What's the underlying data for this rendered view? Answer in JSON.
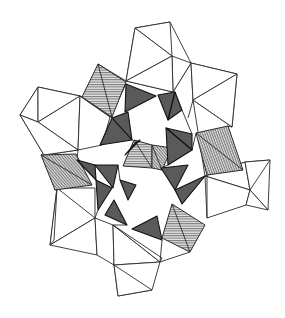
{
  "figure": {
    "title": "",
    "width": 285,
    "height": 318,
    "colors": {
      "background": "#ffffff",
      "line": "#2a2a2a",
      "dark_fill": "#5a5a5a",
      "hatch_line": "#555555",
      "hatch_bg": "#d8d8d8"
    },
    "white_polygons": [
      [
        [
          135,
          28
        ],
        [
          170,
          22
        ],
        [
          191,
          63
        ],
        [
          173,
          92
        ],
        [
          126,
          81
        ]
      ],
      [
        [
          135,
          28
        ],
        [
          172,
          56
        ],
        [
          170,
          22
        ]
      ],
      [
        [
          135,
          28
        ],
        [
          172,
          56
        ],
        [
          126,
          81
        ]
      ],
      [
        [
          172,
          56
        ],
        [
          191,
          63
        ],
        [
          173,
          92
        ]
      ],
      [
        [
          126,
          81
        ],
        [
          172,
          56
        ],
        [
          173,
          92
        ]
      ],
      [
        [
          191,
          63
        ],
        [
          237,
          74
        ],
        [
          232,
          127
        ],
        [
          193,
          100
        ]
      ],
      [
        [
          191,
          63
        ],
        [
          237,
          74
        ],
        [
          193,
          100
        ]
      ],
      [
        [
          193,
          100
        ],
        [
          237,
          74
        ],
        [
          232,
          127
        ]
      ],
      [
        [
          20,
          115
        ],
        [
          38,
          87
        ],
        [
          80,
          96
        ],
        [
          78,
          150
        ],
        [
          44,
          155
        ]
      ],
      [
        [
          20,
          115
        ],
        [
          38,
          87
        ],
        [
          38,
          122
        ]
      ],
      [
        [
          38,
          87
        ],
        [
          80,
          96
        ],
        [
          38,
          122
        ]
      ],
      [
        [
          38,
          122
        ],
        [
          80,
          96
        ],
        [
          78,
          150
        ]
      ],
      [
        [
          20,
          115
        ],
        [
          38,
          122
        ],
        [
          78,
          150
        ],
        [
          44,
          155
        ]
      ],
      [
        [
          80,
          96
        ],
        [
          110,
          117
        ],
        [
          102,
          145
        ],
        [
          78,
          150
        ]
      ],
      [
        [
          205,
          176
        ],
        [
          245,
          162
        ],
        [
          270,
          160
        ],
        [
          268,
          210
        ],
        [
          250,
          190
        ]
      ],
      [
        [
          205,
          176
        ],
        [
          245,
          162
        ],
        [
          250,
          190
        ]
      ],
      [
        [
          245,
          162
        ],
        [
          270,
          160
        ],
        [
          250,
          190
        ]
      ],
      [
        [
          205,
          176
        ],
        [
          250,
          190
        ],
        [
          246,
          205
        ],
        [
          207,
          218
        ]
      ],
      [
        [
          250,
          190
        ],
        [
          268,
          210
        ],
        [
          246,
          205
        ]
      ],
      [
        [
          57,
          188
        ],
        [
          95,
          188
        ],
        [
          95,
          218
        ],
        [
          50,
          245
        ]
      ],
      [
        [
          57,
          188
        ],
        [
          95,
          218
        ],
        [
          50,
          245
        ]
      ],
      [
        [
          50,
          245
        ],
        [
          95,
          218
        ],
        [
          97,
          255
        ]
      ],
      [
        [
          95,
          218
        ],
        [
          113,
          225
        ],
        [
          114,
          265
        ],
        [
          97,
          255
        ]
      ],
      [
        [
          113,
          225
        ],
        [
          160,
          262
        ],
        [
          114,
          265
        ]
      ],
      [
        [
          114,
          265
        ],
        [
          160,
          262
        ],
        [
          152,
          290
        ],
        [
          118,
          296
        ]
      ],
      [
        [
          114,
          265
        ],
        [
          152,
          290
        ],
        [
          118,
          296
        ]
      ],
      [
        [
          113,
          225
        ],
        [
          160,
          262
        ],
        [
          162,
          258
        ]
      ]
    ],
    "dark_triangles": [
      [
        [
          126,
          84
        ],
        [
          156,
          96
        ],
        [
          125,
          112
        ]
      ],
      [
        [
          158,
          95
        ],
        [
          175,
          92
        ],
        [
          168,
          120
        ]
      ],
      [
        [
          168,
          120
        ],
        [
          182,
          110
        ],
        [
          175,
          92
        ]
      ],
      [
        [
          112,
          118
        ],
        [
          128,
          112
        ],
        [
          132,
          140
        ]
      ],
      [
        [
          100,
          145
        ],
        [
          112,
          118
        ],
        [
          132,
          140
        ]
      ],
      [
        [
          166,
          128
        ],
        [
          192,
          134
        ],
        [
          192,
          150
        ]
      ],
      [
        [
          166,
          128
        ],
        [
          168,
          165
        ],
        [
          192,
          150
        ]
      ],
      [
        [
          77,
          160
        ],
        [
          95,
          165
        ],
        [
          96,
          180
        ]
      ],
      [
        [
          95,
          165
        ],
        [
          118,
          165
        ],
        [
          113,
          188
        ]
      ],
      [
        [
          96,
          180
        ],
        [
          112,
          188
        ],
        [
          98,
          210
        ]
      ],
      [
        [
          161,
          168
        ],
        [
          188,
          165
        ],
        [
          175,
          190
        ]
      ],
      [
        [
          175,
          190
        ],
        [
          205,
          176
        ],
        [
          182,
          204
        ]
      ],
      [
        [
          105,
          215
        ],
        [
          114,
          200
        ],
        [
          127,
          225
        ]
      ],
      [
        [
          132,
          229
        ],
        [
          157,
          216
        ],
        [
          162,
          240
        ]
      ],
      [
        [
          135,
          143
        ],
        [
          140,
          140
        ],
        [
          125,
          155
        ]
      ],
      [
        [
          120,
          180
        ],
        [
          136,
          185
        ],
        [
          128,
          200
        ]
      ]
    ],
    "hatched_squares": [
      {
        "points": [
          [
            98,
            64
          ],
          [
            126,
            82
          ],
          [
            112,
            117
          ],
          [
            82,
            97
          ]
        ],
        "angle": 0
      },
      {
        "points": [
          [
            196,
            133
          ],
          [
            228,
            126
          ],
          [
            243,
            170
          ],
          [
            207,
            175
          ]
        ],
        "angle": 70
      },
      {
        "points": [
          [
            41,
            155
          ],
          [
            76,
            154
          ],
          [
            92,
            185
          ],
          [
            55,
            190
          ]
        ],
        "angle": 50
      },
      {
        "points": [
          [
            172,
            204
          ],
          [
            205,
            225
          ],
          [
            190,
            252
          ],
          [
            162,
            238
          ]
        ],
        "angle": 0
      },
      {
        "points": [
          [
            134,
            140
          ],
          [
            152,
            145
          ],
          [
            152,
            168
          ],
          [
            123,
            166
          ]
        ],
        "angle": 0
      },
      {
        "points": [
          [
            152,
            145
          ],
          [
            172,
            148
          ],
          [
            162,
            170
          ],
          [
            152,
            168
          ]
        ],
        "angle": 50
      }
    ],
    "edges": [
      [
        [
          126,
          81
        ],
        [
          98,
          64
        ]
      ],
      [
        [
          82,
          97
        ],
        [
          80,
          96
        ]
      ],
      [
        [
          193,
          100
        ],
        [
          188,
          118
        ]
      ],
      [
        [
          232,
          127
        ],
        [
          228,
          126
        ]
      ],
      [
        [
          193,
          100
        ],
        [
          205,
          176
        ]
      ],
      [
        [
          207,
          218
        ],
        [
          207,
          176
        ]
      ],
      [
        [
          205,
          176
        ],
        [
          182,
          204
        ]
      ],
      [
        [
          98,
          210
        ],
        [
          95,
          218
        ]
      ],
      [
        [
          113,
          225
        ],
        [
          127,
          225
        ]
      ],
      [
        [
          160,
          262
        ],
        [
          162,
          240
        ]
      ],
      [
        [
          160,
          262
        ],
        [
          190,
          252
        ]
      ],
      [
        [
          54,
          190
        ],
        [
          57,
          188
        ]
      ],
      [
        [
          78,
          150
        ],
        [
          77,
          160
        ]
      ],
      [
        [
          110,
          117
        ],
        [
          126,
          84
        ]
      ],
      [
        [
          80,
          96
        ],
        [
          112,
          118
        ]
      ],
      [
        [
          44,
          155
        ],
        [
          41,
          155
        ]
      ],
      [
        [
          168,
          165
        ],
        [
          161,
          168
        ]
      ],
      [
        [
          118,
          165
        ],
        [
          120,
          180
        ]
      ],
      [
        [
          192,
          150
        ],
        [
          196,
          133
        ]
      ],
      [
        [
          182,
          110
        ],
        [
          192,
          134
        ]
      ],
      [
        [
          57,
          188
        ],
        [
          54,
          240
        ]
      ],
      [
        [
          50,
          245
        ],
        [
          54,
          240
        ]
      ]
    ]
  }
}
